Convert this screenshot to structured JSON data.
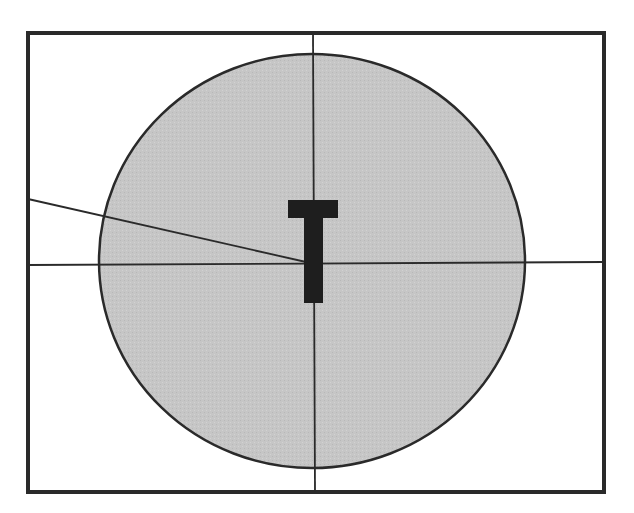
{
  "diagram": {
    "type": "schematic",
    "canvas": {
      "width": 634,
      "height": 513,
      "background": "#ffffff"
    },
    "frame": {
      "x": 28,
      "y": 33,
      "width": 576,
      "height": 459,
      "stroke": "#2a2a2a",
      "stroke_width": 4
    },
    "circle": {
      "cx": 312,
      "cy": 261,
      "rx": 213,
      "ry": 207,
      "fill": "#c6c6c6",
      "stroke": "#2a2a2a",
      "stroke_width": 2.5
    },
    "crosshair": {
      "vertical": {
        "x1": 313,
        "y1": 33,
        "x2": 315,
        "y2": 492
      },
      "horizontal": {
        "x1": 28,
        "y1": 265,
        "x2": 604,
        "y2": 262
      },
      "stroke": "#2a2a2a",
      "stroke_width": 1.8
    },
    "pointer_line": {
      "x1": 28,
      "y1": 199,
      "x2": 306,
      "y2": 262,
      "stroke": "#2a2a2a",
      "stroke_width": 1.8
    },
    "t_marker": {
      "label": "T",
      "crossbar": {
        "x": 288,
        "y": 200,
        "width": 50,
        "height": 18
      },
      "stem": {
        "x": 304,
        "y": 200,
        "width": 19,
        "height": 103
      },
      "fill": "#1e1e1e"
    }
  }
}
